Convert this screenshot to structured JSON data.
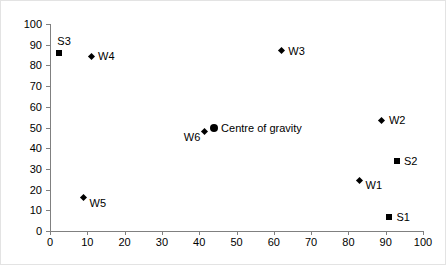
{
  "chart_data": {
    "type": "scatter",
    "title": "",
    "xlabel": "",
    "ylabel": "",
    "xlim": [
      0,
      100
    ],
    "ylim": [
      0,
      100
    ],
    "xticks": [
      0,
      10,
      20,
      30,
      40,
      50,
      60,
      70,
      80,
      90,
      100
    ],
    "yticks": [
      0,
      10,
      20,
      30,
      40,
      50,
      60,
      70,
      80,
      90,
      100
    ],
    "grid": false,
    "legend": "none",
    "marker_color": "#000000",
    "axis_color": "#808080",
    "points": [
      {
        "label": "S3",
        "x": 2.5,
        "y": 86.0,
        "marker": "square",
        "label_pos": "above-right"
      },
      {
        "label": "W4",
        "x": 11.0,
        "y": 84.5,
        "marker": "diamond",
        "label_pos": "right"
      },
      {
        "label": "W3",
        "x": 62.0,
        "y": 87.0,
        "marker": "diamond",
        "label_pos": "right"
      },
      {
        "label": "W5",
        "x": 9.0,
        "y": 16.0,
        "marker": "diamond",
        "label_pos": "below-right"
      },
      {
        "label": "W6",
        "x": 41.5,
        "y": 48.0,
        "marker": "diamond",
        "label_pos": "below-left"
      },
      {
        "label": "Centre of gravity",
        "x": 44.0,
        "y": 50.0,
        "marker": "circle",
        "label_pos": "right"
      },
      {
        "label": "W2",
        "x": 89.0,
        "y": 53.5,
        "marker": "diamond",
        "label_pos": "right"
      },
      {
        "label": "S2",
        "x": 93.0,
        "y": 34.0,
        "marker": "square",
        "label_pos": "right"
      },
      {
        "label": "W1",
        "x": 83.0,
        "y": 24.5,
        "marker": "diamond",
        "label_pos": "below-right"
      },
      {
        "label": "S1",
        "x": 91.0,
        "y": 7.0,
        "marker": "square",
        "label_pos": "right"
      }
    ]
  }
}
